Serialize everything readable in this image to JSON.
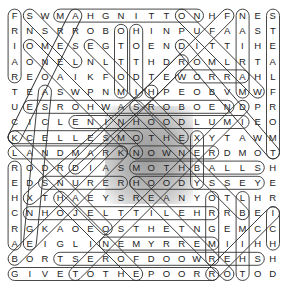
{
  "puzzle": {
    "type": "word-search",
    "rows": 18,
    "cols": 18,
    "grid": [
      "FSWMAHGNITTONHFNES",
      "RNSRROBOHINPUFAAST",
      "IOMESEGTOENDITTIHE",
      "AONELNLTTHDROMLRTA",
      "REOAIKFODTEWORRAHL",
      "TEASWPNMIHPEOBVMWF",
      "UESROHWASROBOENDPR",
      "CICLENINHOODLUMIEO",
      "KCELLESMOTHEXYTAWM",
      "LANDMARKNOWNERDMOT",
      "RODRDIASMOTHBALLSH",
      "EDSNURERHOODYSSEYE",
      "HXTHAEYSREANYOTLHR",
      "CNHOJELTTILEHRRBEI",
      "RGKAOEOSTHETNGEMCC",
      "AEIGLINEMYRREMIIHH",
      "BORTSEROFDOOWREHSH",
      "GIVETOTHEPOORROTOD"
    ],
    "found_words_horizontal": [
      {
        "word": "MAHGNITTON",
        "row": 0,
        "c1": 3,
        "c2": 12
      },
      {
        "word": "WORRA",
        "row": 4,
        "c1": 11,
        "c2": 15
      },
      {
        "word": "ESROHWASROBOEN",
        "row": 6,
        "c1": 1,
        "c2": 14
      },
      {
        "word": "NINHOODLUM",
        "row": 7,
        "c1": 4,
        "c2": 15
      },
      {
        "word": "CELLESMOTHEXY",
        "row": 8,
        "c1": 0,
        "c2": 8
      },
      {
        "word": "LANDMARK",
        "row": 9,
        "c1": 0,
        "c2": 7
      },
      {
        "word": "NOWNER",
        "row": 9,
        "c1": 8,
        "c2": 13
      },
      {
        "word": "MOTHBALLS",
        "row": 10,
        "c1": 8,
        "c2": 16
      },
      {
        "word": "SNURER",
        "row": 11,
        "c1": 2,
        "c2": 7
      },
      {
        "word": "HOODYSSEY",
        "row": 11,
        "c1": 8,
        "c2": 16
      },
      {
        "word": "NHOJELTTILEHR",
        "row": 13,
        "c1": 1,
        "c2": 13
      },
      {
        "word": "NEMYRREM",
        "row": 15,
        "c1": 6,
        "c2": 13
      },
      {
        "word": "TSEROFDOOWREHS",
        "row": 16,
        "c1": 3,
        "c2": 16
      },
      {
        "word": "GIVETOTHEPOOR",
        "row": 17,
        "c1": 0,
        "c2": 13
      }
    ],
    "found_words_vertical": [
      {
        "col": 0,
        "r1": 0,
        "r2": 4
      },
      {
        "col": 0,
        "r1": 10,
        "r2": 15
      },
      {
        "col": 7,
        "r1": 1,
        "r2": 5
      },
      {
        "col": 8,
        "r1": 1,
        "r2": 5
      },
      {
        "col": 15,
        "r1": 0,
        "r2": 5
      },
      {
        "col": 17,
        "r1": 0,
        "r2": 9
      },
      {
        "col": 17,
        "r1": 13,
        "r2": 15
      },
      {
        "col": 13,
        "r1": 12,
        "r2": 16
      },
      {
        "col": 12,
        "r1": 8,
        "r2": 11
      },
      {
        "col": 15,
        "r1": 12,
        "r2": 17
      }
    ],
    "diagonals": [
      [
        [
          0,
          1
        ],
        [
          3,
          4
        ]
      ],
      [
        [
          0,
          4
        ],
        [
          8,
          0
        ]
      ],
      [
        [
          2,
          1
        ],
        [
          9,
          8
        ]
      ],
      [
        [
          0,
          14
        ],
        [
          5,
          9
        ]
      ],
      [
        [
          0,
          11
        ],
        [
          5,
          16
        ]
      ],
      [
        [
          2,
          11
        ],
        [
          9,
          17
        ]
      ],
      [
        [
          3,
          11
        ],
        [
          10,
          4
        ]
      ],
      [
        [
          5,
          9
        ],
        [
          12,
          1
        ]
      ],
      [
        [
          5,
          2
        ],
        [
          15,
          1
        ]
      ],
      [
        [
          6,
          15
        ],
        [
          17,
          4
        ]
      ],
      [
        [
          6,
          8
        ],
        [
          13,
          15
        ]
      ],
      [
        [
          8,
          0
        ],
        [
          14,
          6
        ]
      ],
      [
        [
          12,
          3
        ],
        [
          17,
          8
        ]
      ],
      [
        [
          11,
          8
        ],
        [
          17,
          14
        ]
      ],
      [
        [
          13,
          17
        ],
        [
          17,
          13
        ]
      ],
      [
        [
          2,
          5
        ],
        [
          8,
          11
        ]
      ],
      [
        [
          9,
          7
        ],
        [
          16,
          0
        ]
      ]
    ]
  }
}
